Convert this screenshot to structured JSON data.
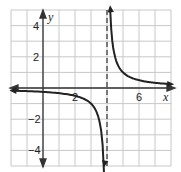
{
  "chart_data": {
    "type": "line",
    "title": "",
    "function": "y = 1/(x - 4)",
    "xlabel": "x",
    "ylabel": "y",
    "xlim": [
      -2,
      8
    ],
    "ylim": [
      -5,
      5
    ],
    "grid": true,
    "x_tick_labels": [
      "2",
      "6"
    ],
    "y_tick_labels": [
      "4",
      "2",
      "-2",
      "-4"
    ],
    "vertical_asymptote": 4,
    "horizontal_asymptote": 0,
    "series": [
      {
        "name": "left branch",
        "x": [
          -2,
          -1,
          0,
          1,
          2,
          3,
          3.5,
          3.8
        ],
        "y": [
          -0.17,
          -0.2,
          -0.25,
          -0.33,
          -0.5,
          -1,
          -2,
          -5
        ]
      },
      {
        "name": "right branch",
        "x": [
          4.2,
          4.5,
          5,
          6,
          7,
          8
        ],
        "y": [
          5,
          2,
          1,
          0.5,
          0.33,
          0.25
        ]
      }
    ]
  }
}
